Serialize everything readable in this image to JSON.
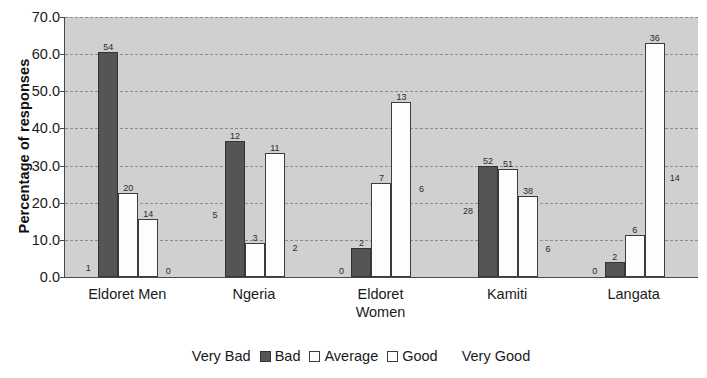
{
  "chart_data": {
    "type": "bar",
    "title": "",
    "xlabel": "",
    "ylabel": "Percentage of responses",
    "ylim": [
      0,
      70
    ],
    "ytick_step": 10,
    "ytick_labels": [
      "0.0",
      "10.0",
      "20.0",
      "30.0",
      "40.0",
      "50.0",
      "60.0",
      "70.0"
    ],
    "grid": true,
    "legend_position": "bottom",
    "categories": [
      "Eldoret Men",
      "Ngeria",
      "Eldoret Women",
      "Kamiti",
      "Langata"
    ],
    "category_lines": [
      [
        "Eldoret Men"
      ],
      [
        "Ngeria"
      ],
      [
        "Eldoret",
        "Women"
      ],
      [
        "Kamiti"
      ],
      [
        "Langata"
      ]
    ],
    "series": [
      {
        "name": "Very Bad",
        "color": "#a8a8a8",
        "values": [
          0.8,
          15.2,
          0.0,
          16.2,
          0.0
        ],
        "labels": [
          "1",
          "5",
          "0",
          "28",
          "0"
        ]
      },
      {
        "name": "Bad",
        "color": "#555555",
        "values": [
          60.7,
          36.5,
          7.8,
          29.8,
          4.0
        ],
        "labels": [
          "54",
          "12",
          "2",
          "52",
          "2"
        ]
      },
      {
        "name": "Average",
        "color": "#fdfdfd",
        "values": [
          22.5,
          9.1,
          25.3,
          29.1,
          11.2
        ],
        "labels": [
          "20",
          "3",
          "7",
          "51",
          "6"
        ]
      },
      {
        "name": "Good",
        "color": "#fdfdfd",
        "values": [
          15.7,
          33.3,
          47.0,
          21.8,
          62.9
        ],
        "labels": [
          "14",
          "11",
          "13",
          "38",
          "36"
        ]
      },
      {
        "name": "Very Good",
        "color": "#454545",
        "values": [
          0.0,
          6.1,
          22.0,
          6.0,
          25.0
        ],
        "labels": [
          "0",
          "2",
          "6",
          "6",
          "14"
        ]
      }
    ]
  },
  "axis": {
    "y_title": "Percentage of responses"
  },
  "legend": {
    "items": [
      {
        "label": "Very Bad"
      },
      {
        "label": "Bad"
      },
      {
        "label": "Average"
      },
      {
        "label": "Good"
      },
      {
        "label": "Very Good"
      }
    ]
  }
}
